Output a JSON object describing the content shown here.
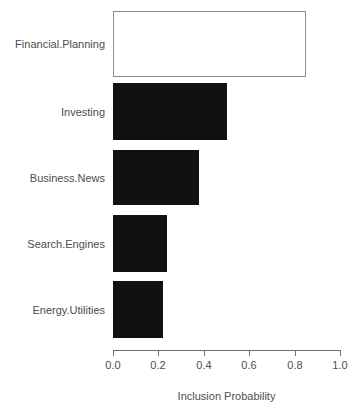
{
  "chart_data": {
    "type": "bar",
    "orientation": "horizontal",
    "title": "",
    "subtitle": "",
    "xlabel": "Inclusion Probability",
    "ylabel": "",
    "categories": [
      "Financial.Planning",
      "Investing",
      "Business.News",
      "Search.Engines",
      "Energy.Utilities"
    ],
    "values": [
      0.85,
      0.5,
      0.38,
      0.24,
      0.22
    ],
    "xlim": [
      0.0,
      1.0
    ],
    "xticks": [
      0.0,
      0.2,
      0.4,
      0.6,
      0.8,
      1.0
    ],
    "xtick_labels": [
      "0.0",
      "0.2",
      "0.4",
      "0.6",
      "0.8",
      "1.0"
    ],
    "grid": false,
    "legend": null,
    "bar_styles": [
      "hollow",
      "filled",
      "filled",
      "filled",
      "filled"
    ],
    "colors": {
      "bar_fill": "#111111",
      "bar_hollow_fill": "#ffffff",
      "bar_hollow_border": "#8c8c8c",
      "axis": "#6e6e6e",
      "text": "#4d4d4d",
      "background": "#ffffff"
    }
  },
  "axis": {
    "title": "Inclusion Probability",
    "ticks": [
      {
        "label": "0.0"
      },
      {
        "label": "0.2"
      },
      {
        "label": "0.4"
      },
      {
        "label": "0.6"
      },
      {
        "label": "0.8"
      },
      {
        "label": "1.0"
      }
    ]
  },
  "bars": [
    {
      "label": "Financial.Planning",
      "value": 0.85
    },
    {
      "label": "Investing",
      "value": 0.5
    },
    {
      "label": "Business.News",
      "value": 0.38
    },
    {
      "label": "Search.Engines",
      "value": 0.24
    },
    {
      "label": "Energy.Utilities",
      "value": 0.22
    }
  ]
}
